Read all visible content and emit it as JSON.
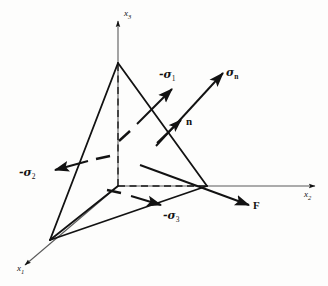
{
  "figure": {
    "background_color": "#fdfdfc",
    "ink_color": "#121212",
    "axes": [
      {
        "id": "x1",
        "name": "x1-axis",
        "label_main": "x",
        "label_sub": "1",
        "x": 22,
        "y": 268,
        "label_x": 18,
        "label_y": 264
      },
      {
        "id": "x2",
        "name": "x2-axis",
        "label_main": "x",
        "label_sub": "2",
        "x": 318,
        "y": 186,
        "label_x": 305,
        "label_y": 190
      },
      {
        "id": "x3",
        "name": "x3-axis",
        "label_main": "x",
        "label_sub": "3",
        "x": 118,
        "y": 18,
        "label_x": 124,
        "label_y": 10
      }
    ],
    "vectors": [
      {
        "id": "sigma_n",
        "name": "sigma-n-vector",
        "label": "σ",
        "sub": "n",
        "sub_bold": true,
        "label_x": 226,
        "label_y": 68
      },
      {
        "id": "n",
        "name": "n-normal-vector",
        "label": "n",
        "sub": "",
        "sub_bold": false,
        "label_x": 186,
        "label_y": 117
      },
      {
        "id": "F",
        "name": "F-force-vector",
        "label": "F",
        "sub": "",
        "sub_bold": false,
        "label_x": 253,
        "label_y": 201
      },
      {
        "id": "neg_sigma_1",
        "name": "negative-sigma-1-vector",
        "label": "-σ",
        "sub": "1",
        "sub_bold": false,
        "label_x": 160,
        "label_y": 70
      },
      {
        "id": "neg_sigma_2",
        "name": "negative-sigma-2-vector",
        "label": "-σ",
        "sub": "2",
        "sub_bold": false,
        "label_x": 20,
        "label_y": 168
      },
      {
        "id": "neg_sigma_3",
        "name": "negative-sigma-3-vector",
        "label": "-σ",
        "sub": "3",
        "sub_bold": false,
        "label_x": 163,
        "label_y": 211
      }
    ],
    "geometry": {
      "origin": {
        "x": 118,
        "y": 186
      },
      "vertex_x1": {
        "x": 50,
        "y": 240
      },
      "vertex_x2": {
        "x": 207,
        "y": 186
      },
      "vertex_x3": {
        "x": 118,
        "y": 63
      }
    }
  }
}
